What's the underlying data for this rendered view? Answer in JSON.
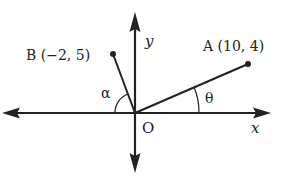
{
  "diagram": {
    "type": "coordinate-plane",
    "axes": {
      "x_label": "x",
      "y_label": "y",
      "origin_label": "O"
    },
    "points": [
      {
        "id": "A",
        "label": "A (10, 4)",
        "x": 10,
        "y": 4
      },
      {
        "id": "B",
        "label": "B (−2, 5)",
        "x": -2,
        "y": 5
      }
    ],
    "angles": [
      {
        "id": "theta",
        "label": "θ",
        "between": "positive x-axis and OA"
      },
      {
        "id": "alpha",
        "label": "α",
        "between": "negative x-axis and OB"
      }
    ],
    "colors": {
      "ink": "#222222",
      "background": "#ffffff"
    }
  }
}
